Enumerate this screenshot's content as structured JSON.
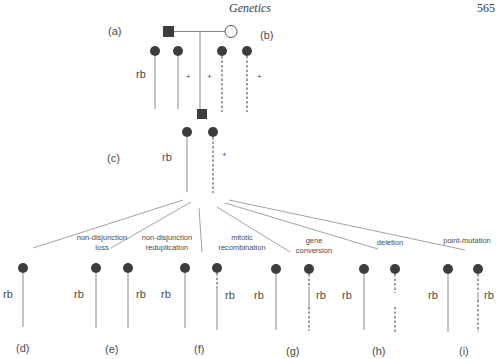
{
  "header": {
    "running_title": "Genetics",
    "page_number": "565"
  },
  "labels": {
    "a": "(a)",
    "b": "(b)",
    "c": "(c)",
    "d": "(d)",
    "e": "(e)",
    "f": "(f)",
    "g": "(g)",
    "h": "(h)",
    "i": "(i)"
  },
  "alleles": {
    "mutant": "rb",
    "wild": "+"
  },
  "mechanisms": [
    {
      "line1": "non-disjunction",
      "line2": "loss"
    },
    {
      "line1": "non-disjunction",
      "line2": "reduplication"
    },
    {
      "line1": "mitotic",
      "line2": "recombination"
    },
    {
      "line1": "gene",
      "line2": "conversion"
    },
    {
      "line1": "deletion",
      "line2": ""
    },
    {
      "line1": "point-mutation",
      "line2": ""
    }
  ],
  "colors": {
    "symbol_fill": "#3d3d3d",
    "line": "#8a8a8a",
    "text": "#4a4a4a"
  }
}
